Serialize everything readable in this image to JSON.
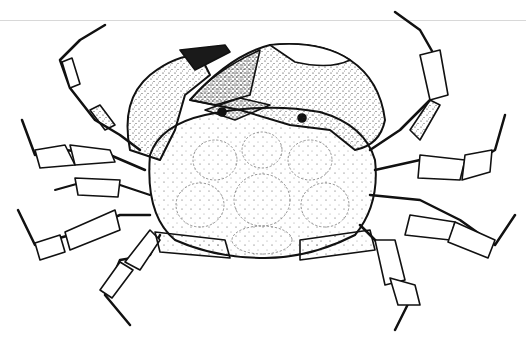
{
  "image": {
    "subject": "Stippled pen-and-ink scientific illustration of a crab, dorsal view",
    "alt": "Crab illustration, dorsal view, with large claws and eight walking legs",
    "colors": {
      "background": "#ffffff",
      "ink": "#111111",
      "rule": "#d8d8d8"
    }
  }
}
